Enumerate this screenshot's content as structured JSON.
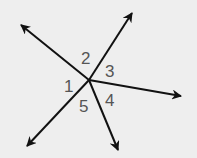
{
  "diagram": {
    "type": "angles-from-point",
    "vertex": {
      "x": 89,
      "y": 80
    },
    "rays": [
      {
        "name": "ray-upper-left",
        "tip": {
          "x": 21,
          "y": 25
        }
      },
      {
        "name": "ray-upper-right",
        "tip": {
          "x": 132,
          "y": 13
        }
      },
      {
        "name": "ray-right",
        "tip": {
          "x": 181,
          "y": 96
        }
      },
      {
        "name": "ray-lower",
        "tip": {
          "x": 118,
          "y": 150
        }
      },
      {
        "name": "ray-lower-left",
        "tip": {
          "x": 27,
          "y": 146
        }
      }
    ],
    "angle_labels": [
      {
        "text": "1",
        "x": 64,
        "y": 92
      },
      {
        "text": "2",
        "x": 81,
        "y": 64
      },
      {
        "text": "3",
        "x": 105,
        "y": 77
      },
      {
        "text": "4",
        "x": 105,
        "y": 106
      },
      {
        "text": "5",
        "x": 79,
        "y": 112
      }
    ],
    "colors": {
      "background": "#eeeeee",
      "line": "#111111",
      "label": "#555555"
    }
  }
}
